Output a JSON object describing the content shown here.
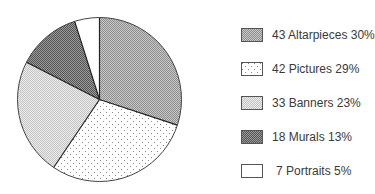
{
  "chart_data": {
    "type": "pie",
    "title": "",
    "slices": [
      {
        "label": "Altarpieces",
        "count": 43,
        "percent": 30,
        "pattern": "fine-gray",
        "color": "#b4b4b4"
      },
      {
        "label": "Pictures",
        "count": 42,
        "percent": 29,
        "pattern": "dots",
        "color": "#ffffff"
      },
      {
        "label": "Banners",
        "count": 33,
        "percent": 23,
        "pattern": "light-gray",
        "color": "#dcdcdc"
      },
      {
        "label": "Murals",
        "count": 18,
        "percent": 13,
        "pattern": "dark-gray",
        "color": "#7a7a7a"
      },
      {
        "label": "Portraits",
        "count": 7,
        "percent": 5,
        "pattern": "white",
        "color": "#ffffff"
      }
    ],
    "legend_position": "right",
    "start_angle": "12 o'clock, clockwise"
  },
  "legend": {
    "items": [
      {
        "text": "43 Altarpieces 30%"
      },
      {
        "text": "42 Pictures 29%"
      },
      {
        "text": "33 Banners 23%"
      },
      {
        "text": " 7 Portraits 5%"
      }
    ],
    "murals_text": "18 Murals 13%",
    "portraits_text": "7 Portraits 5%"
  }
}
